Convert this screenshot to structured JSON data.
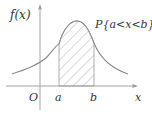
{
  "diagram": {
    "type": "probability-density-curve",
    "y_axis_label": "f(x)",
    "x_axis_label": "x",
    "origin_label": "O",
    "lower_bound_label": "a",
    "upper_bound_label": "b",
    "shaded_region_label": "P{a<x<b}",
    "colors": {
      "axis": "#9a9a9a",
      "curve": "#8a8a8a",
      "hatch": "#a0a0a0",
      "text": "#333333"
    }
  }
}
